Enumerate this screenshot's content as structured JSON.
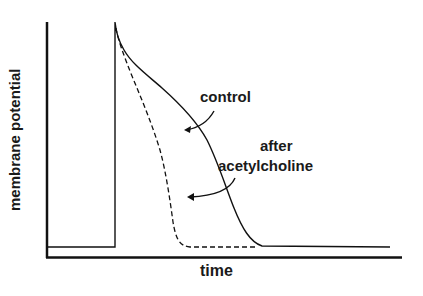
{
  "chart_data": {
    "type": "line",
    "title": "",
    "xlabel": "time",
    "ylabel": "membrane potential",
    "grid": false,
    "legend": "none (inline annotations with arrows)",
    "ticks": {
      "x": [],
      "y": []
    },
    "series": [
      {
        "name": "control",
        "style": "solid",
        "points_px": [
          [
            48,
            247
          ],
          [
            115,
            247
          ],
          [
            115,
            22
          ],
          [
            118,
            38
          ],
          [
            128,
            60
          ],
          [
            150,
            80
          ],
          [
            175,
            100
          ],
          [
            200,
            130
          ],
          [
            215,
            160
          ],
          [
            228,
            195
          ],
          [
            240,
            225
          ],
          [
            255,
            245
          ],
          [
            390,
            247
          ]
        ]
      },
      {
        "name": "after acetylcholine",
        "style": "dashed",
        "points_px": [
          [
            115,
            22
          ],
          [
            118,
            40
          ],
          [
            130,
            80
          ],
          [
            145,
            120
          ],
          [
            158,
            160
          ],
          [
            168,
            200
          ],
          [
            175,
            235
          ],
          [
            185,
            246
          ],
          [
            255,
            247
          ]
        ]
      }
    ],
    "annotations": [
      {
        "text": "control",
        "points_to": "control"
      },
      {
        "text": "after acetylcholine",
        "points_to": "after acetylcholine"
      }
    ]
  },
  "figure": {
    "ylabel": "membrane potential",
    "xlabel": "time",
    "annotations": {
      "control": "control",
      "after_line1": "after",
      "after_line2": "acetylcholine"
    }
  }
}
